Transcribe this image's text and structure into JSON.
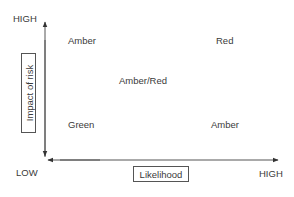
{
  "diagram": {
    "title": "",
    "y_axis": {
      "label": "Impact of risk",
      "high_label": "HIGH"
    },
    "x_axis": {
      "label": "Likelihood",
      "high_label": "HIGH"
    },
    "origin_label": "LOW",
    "quadrants": {
      "top_left": "Amber",
      "top_right": "Red",
      "center": "Amber/Red",
      "bottom_left": "Green",
      "bottom_right": "Amber"
    },
    "colors": {
      "line": "#444444",
      "text": "#3a3a3a"
    }
  }
}
